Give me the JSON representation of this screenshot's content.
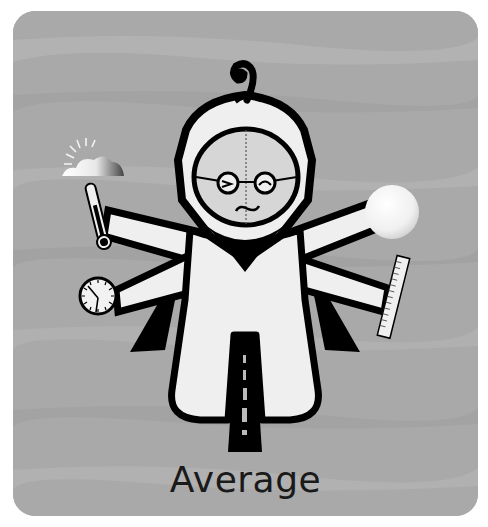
{
  "illustration": {
    "subject": "multi-armed character holding weather, thermometer, clock, ball and ruler",
    "caption": "Average",
    "colors": {
      "background": "#a9a9a9",
      "stripe_light": "#b3b3b3",
      "stripe_dark": "#a2a2a2",
      "outline": "#000000",
      "body_fill": "#efefef",
      "face_fill": "#d6d6d6"
    },
    "props": [
      {
        "name": "weather-cloud-sun-icon"
      },
      {
        "name": "thermometer-icon"
      },
      {
        "name": "clock-icon"
      },
      {
        "name": "ball-icon"
      },
      {
        "name": "ruler-icon"
      },
      {
        "name": "road-icon"
      }
    ]
  }
}
